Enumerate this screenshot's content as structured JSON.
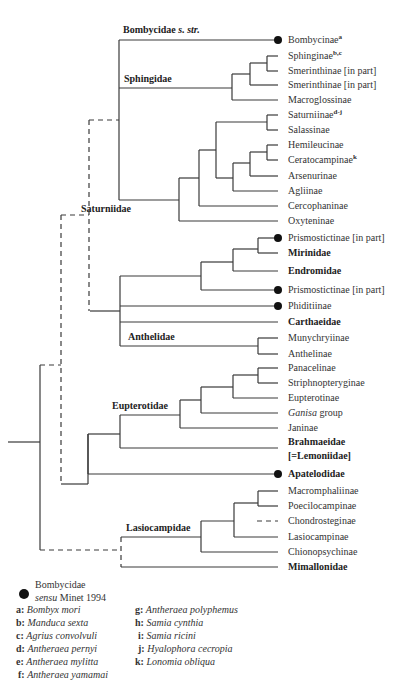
{
  "group_labels": {
    "bombycidae": "Bombycidae s. str.",
    "bombycidae_main": "Bombycidae ",
    "bombycidae_italic": "s. str.",
    "sphingidae": "Sphingidae",
    "saturniidae": "Saturniidae",
    "anthelidae": "Anthelidae",
    "eupterotidae": "Eupterotidae",
    "lasiocampidae": "Lasiocampidae"
  },
  "leaves": [
    {
      "label": "Bombycinae",
      "sup": "a",
      "y": 40,
      "dot": true,
      "bold": false
    },
    {
      "label": "Sphinginae",
      "sup": "b,c",
      "y": 56,
      "dot": false,
      "bold": false
    },
    {
      "label": "Smerinthinae [in part]",
      "sup": "",
      "y": 71,
      "dot": false,
      "bold": false
    },
    {
      "label": "Smerinthinae [in part]",
      "sup": "",
      "y": 85,
      "dot": false,
      "bold": false
    },
    {
      "label": "Macroglossinae",
      "sup": "",
      "y": 100,
      "dot": false,
      "bold": false
    },
    {
      "label": "Saturniinae",
      "sup": "d-j",
      "y": 115,
      "dot": false,
      "bold": false
    },
    {
      "label": "Salassinae",
      "sup": "",
      "y": 130,
      "dot": false,
      "bold": false
    },
    {
      "label": "Hemileucinae",
      "sup": "",
      "y": 145,
      "dot": false,
      "bold": false
    },
    {
      "label": "Ceratocampinae",
      "sup": "k",
      "y": 160,
      "dot": false,
      "bold": false
    },
    {
      "label": "Arsenurinae",
      "sup": "",
      "y": 176,
      "dot": false,
      "bold": false
    },
    {
      "label": "Agliinae",
      "sup": "",
      "y": 191,
      "dot": false,
      "bold": false
    },
    {
      "label": "Cercophaninae",
      "sup": "",
      "y": 206,
      "dot": false,
      "bold": false
    },
    {
      "label": "Oxyteninae",
      "sup": "",
      "y": 221,
      "dot": false,
      "bold": false
    },
    {
      "label": "Prismostictinae [in part]",
      "sup": "",
      "y": 238,
      "dot": true,
      "bold": false
    },
    {
      "label": "Mirinidae",
      "sup": "",
      "y": 253,
      "dot": false,
      "bold": true
    },
    {
      "label": "Endromidae",
      "sup": "",
      "y": 271,
      "dot": false,
      "bold": true
    },
    {
      "label": "Prismostictinae [in part]",
      "sup": "",
      "y": 290,
      "dot": true,
      "bold": false
    },
    {
      "label": "Phiditiinae",
      "sup": "",
      "y": 306,
      "dot": true,
      "bold": false
    },
    {
      "label": "Carthaeidae",
      "sup": "",
      "y": 322,
      "dot": false,
      "bold": true
    },
    {
      "label": "Munychryiinae",
      "sup": "",
      "y": 338,
      "dot": false,
      "bold": false
    },
    {
      "label": "Anthelinae",
      "sup": "",
      "y": 354,
      "dot": false,
      "bold": false
    },
    {
      "label": "Panacelinae",
      "sup": "",
      "y": 368,
      "dot": false,
      "bold": false
    },
    {
      "label": "Striphnopteryginae",
      "sup": "",
      "y": 383,
      "dot": false,
      "bold": false
    },
    {
      "label": "Eupterotinae",
      "sup": "",
      "y": 398,
      "dot": false,
      "bold": false
    },
    {
      "label": "group",
      "sup": "",
      "y": 413,
      "dot": false,
      "bold": false,
      "italic_prefix": "Ganisa"
    },
    {
      "label": "Janinae",
      "sup": "",
      "y": 428,
      "dot": false,
      "bold": false
    },
    {
      "label": "Brahmaeidae",
      "sup": "",
      "y": 442,
      "dot": false,
      "bold": true
    },
    {
      "label": "[=Lemoniidae]",
      "sup": "",
      "y": 456,
      "dot": false,
      "bold": true,
      "noline": true
    },
    {
      "label": "Apatelodidae",
      "sup": "",
      "y": 474,
      "dot": true,
      "bold": true
    },
    {
      "label": "Macromphaliinae",
      "sup": "",
      "y": 491,
      "dot": false,
      "bold": false
    },
    {
      "label": "Poecilocampinae",
      "sup": "",
      "y": 506,
      "dot": false,
      "bold": false
    },
    {
      "label": "Chondrosteginae",
      "sup": "",
      "y": 521,
      "dot": false,
      "bold": false,
      "dashed": true
    },
    {
      "label": "Lasiocampinae",
      "sup": "",
      "y": 537,
      "dot": false,
      "bold": false
    },
    {
      "label": "Chionopsychinae",
      "sup": "",
      "y": 552,
      "dot": false,
      "bold": false
    },
    {
      "label": "Mimallonidae",
      "sup": "",
      "y": 567,
      "dot": false,
      "bold": true
    }
  ],
  "legend": {
    "dot_line1": "Bombycidae",
    "dot_line2_italic": "sensu",
    "dot_line2_rest": " Minet 1994",
    "species_left": [
      {
        "key": "a:",
        "name": "Bombyx mori"
      },
      {
        "key": "b:",
        "name": "Manduca sexta"
      },
      {
        "key": "c:",
        "name": "Agrius convolvuli"
      },
      {
        "key": "d:",
        "name": "Antheraea pernyi"
      },
      {
        "key": "e:",
        "name": "Antheraea mylitta"
      },
      {
        "key": "f:",
        "name": "Antheraea yamamai"
      }
    ],
    "species_right": [
      {
        "key": "g:",
        "name": "Antheraea polyphemus"
      },
      {
        "key": "h:",
        "name": "Samia cynthia"
      },
      {
        "key": "i:",
        "name": "Samia ricini"
      },
      {
        "key": "j:",
        "name": "Hyalophora cecropia"
      },
      {
        "key": "k:",
        "name": "Lonomia obliqua"
      }
    ]
  },
  "colors": {
    "line": "#3a3a3a",
    "dot": "#111111",
    "text": "#333333"
  }
}
